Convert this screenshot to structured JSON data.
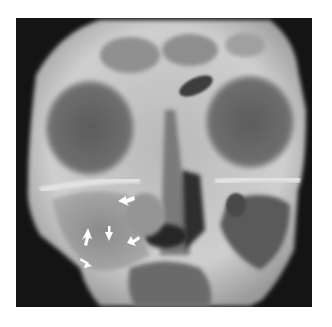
{
  "figure": {
    "type": "radiograph",
    "view": "occipitomental (Waters) skull view",
    "background": "#ffffff",
    "film_background": "#141414",
    "annotations": {
      "arrow_count": 6,
      "arrow_color": "#ffffff",
      "arrows": [
        {
          "x": 125,
          "y": 200,
          "direction": "down-left"
        },
        {
          "x": 87,
          "y": 237,
          "direction": "up-right"
        },
        {
          "x": 109,
          "y": 235,
          "direction": "down"
        },
        {
          "x": 131,
          "y": 240,
          "direction": "down-left"
        },
        {
          "x": 87,
          "y": 263,
          "direction": "down-right"
        }
      ]
    }
  }
}
